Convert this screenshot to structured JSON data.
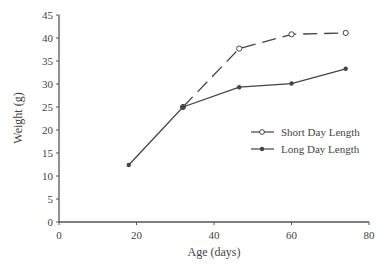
{
  "chart_data": {
    "type": "line",
    "title": "",
    "xlabel": "Age (days)",
    "ylabel": "Weight (g)",
    "xlim": [
      0,
      80
    ],
    "ylim": [
      0,
      45
    ],
    "xticks": [
      0,
      20,
      40,
      60,
      80
    ],
    "yticks": [
      0,
      5,
      10,
      15,
      20,
      25,
      30,
      35,
      40,
      45
    ],
    "grid": false,
    "legend_position": "right-center",
    "series": [
      {
        "name": "Short Day Length",
        "marker": "open-circle",
        "line_style": "dashed",
        "x": [
          32,
          46.5,
          60,
          74
        ],
        "y": [
          25,
          37.7,
          40.8,
          41.1
        ]
      },
      {
        "name": "Long Day Length",
        "marker": "filled-circle",
        "line_style": "solid",
        "x": [
          18,
          32,
          46.5,
          60,
          74
        ],
        "y": [
          12.4,
          25,
          29.3,
          30.1,
          33.3
        ]
      }
    ]
  },
  "colors": {
    "axis": "#555555",
    "line": "#444444",
    "text": "#444444"
  }
}
